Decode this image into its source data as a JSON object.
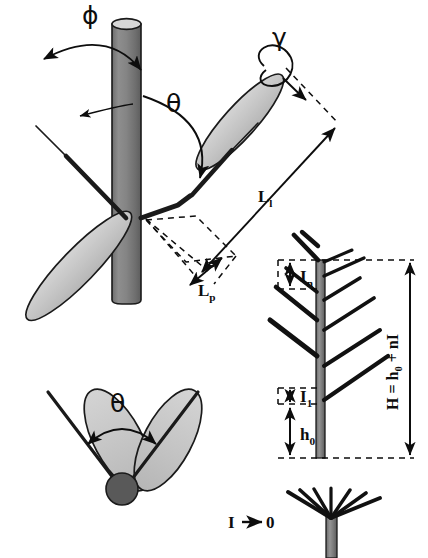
{
  "figure": {
    "title_symbols": {
      "phi": "ϕ",
      "theta_upper": "θ",
      "gamma": "γ",
      "theta_lower": "θ"
    },
    "labels": {
      "phi": "ϕ",
      "theta_upper": "θ",
      "gamma": "γ",
      "theta_lower": "θ",
      "leaf_length": "L",
      "leaf_length_sub": "l",
      "petiole_length": "L",
      "petiole_length_sub": "p",
      "internode_n": "I",
      "internode_n_sub": "n",
      "internode_1": "I",
      "internode_1_sub": "1",
      "base_height": "h",
      "base_height_sub": "0",
      "total_height": "H = h",
      "total_height_sub": "0",
      "total_height_tail": " + nI",
      "limit_note": "I",
      "limit_arrow": "→",
      "limit_value": "0"
    },
    "colors": {
      "background": "#ffffff",
      "stem_fill": "#808080",
      "stem_stroke": "#1a1a1a",
      "stem_highlight": "#9a9a9a",
      "leaf_fill": "#c9c9c9",
      "leaf_stroke": "#1a1a1a",
      "midrib": "#1a1a1a",
      "node_fill": "#595959",
      "line": "#0d0d0d",
      "dashed": "#0d0d0d",
      "branch": "#111111",
      "label_text": "#0d0d0d"
    },
    "panels": [
      {
        "name": "upper-left-side-view",
        "description": "Vertical stem with two opposite leaves showing angles phi, theta, gamma and lengths L_l, L_p"
      },
      {
        "name": "lower-left-top-view",
        "description": "Top view of two leaves on a node showing divergence angle theta"
      },
      {
        "name": "right-shoot-architecture",
        "description": "Shoot with internodes I_n, I_1, base height h_0 and total height H = h_0 + nI"
      },
      {
        "name": "bottom-right-whorl",
        "description": "Degenerate whorl case when internode length I tends to 0"
      }
    ]
  }
}
